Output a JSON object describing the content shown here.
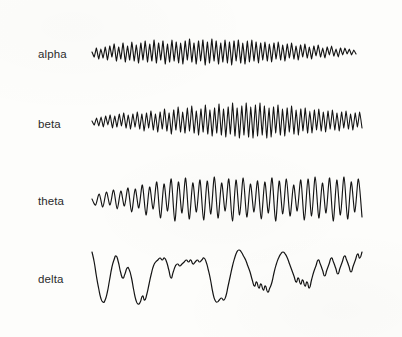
{
  "figure": {
    "width": 402,
    "height": 337,
    "background_color": "#fdfdfb",
    "trace_color": "#141414",
    "label_color": "#2b2b2b"
  },
  "traces": [
    {
      "label": "alpha",
      "label_x": 38,
      "label_y": 49,
      "baseline_y": 52,
      "x_start": 92,
      "x_end": 356,
      "stroke_width": 1.15,
      "description": "alpha rhythm, ~8-12 Hz low amplitude regular oscillation"
    },
    {
      "label": "beta",
      "label_x": 38,
      "label_y": 119,
      "baseline_y": 121,
      "x_start": 92,
      "x_end": 362,
      "stroke_width": 1.1,
      "description": "beta rhythm, fast low amplitude desynchronised activity increasing toward the right"
    },
    {
      "label": "theta",
      "label_x": 38,
      "label_y": 196,
      "baseline_y": 199,
      "x_start": 92,
      "x_end": 362,
      "stroke_width": 1.15,
      "description": "theta rhythm, ~4-7 Hz moderate amplitude waves"
    },
    {
      "label": "delta",
      "label_x": 38,
      "label_y": 274,
      "baseline_y": 276,
      "x_start": 92,
      "x_end": 362,
      "stroke_width": 1.2,
      "description": "delta rhythm, slow high amplitude rolling waves"
    }
  ],
  "chart_data": {
    "type": "line",
    "title": "",
    "xlabel": "",
    "ylabel": "",
    "grid": false,
    "legend_position": "left-labels",
    "axis_visible": false,
    "series": [
      {
        "name": "alpha",
        "x_range": [
          92,
          356
        ],
        "y_center": 52,
        "amplitude_range": [
          5,
          11
        ],
        "values": [
          0,
          -5,
          4,
          -7,
          3,
          -6,
          5,
          -8,
          6,
          -5,
          8,
          -9,
          5,
          -7,
          9,
          -10,
          6,
          -8,
          10,
          -9,
          7,
          -11,
          9,
          -8,
          11,
          -10,
          8,
          -9,
          12,
          -11,
          9,
          -8,
          11,
          -12,
          8,
          -10,
          12,
          -9,
          10,
          -11,
          9,
          -12,
          11,
          -8,
          13,
          -10,
          9,
          -12,
          11,
          -9,
          12,
          -13,
          10,
          -11,
          13,
          -9,
          11,
          -12,
          9,
          -10,
          12,
          -11,
          10,
          -13,
          11,
          -9,
          12,
          -11,
          9,
          -12,
          11,
          -10,
          12,
          -9,
          10,
          -11,
          9,
          -8,
          10,
          -9,
          8,
          -10,
          9,
          -7,
          10,
          -8,
          7,
          -9,
          8,
          -6,
          9,
          -7,
          6,
          -8,
          7,
          -5,
          8,
          -6,
          5,
          -7,
          6,
          -4,
          7,
          -5,
          4,
          -6,
          5,
          -3,
          6,
          -4,
          3,
          -5,
          4,
          -3,
          4,
          -2,
          3,
          -3,
          2,
          -2
        ]
      },
      {
        "name": "beta",
        "x_range": [
          92,
          362
        ],
        "y_center": 121,
        "amplitude_range": [
          4,
          18
        ],
        "values": [
          0,
          -4,
          3,
          -5,
          4,
          -6,
          5,
          -4,
          6,
          -7,
          5,
          -6,
          7,
          -5,
          8,
          -7,
          6,
          -8,
          7,
          -6,
          9,
          -8,
          7,
          -10,
          8,
          -7,
          10,
          -9,
          7,
          -11,
          9,
          -8,
          12,
          -10,
          8,
          -13,
          11,
          -9,
          14,
          -11,
          9,
          -12,
          13,
          -10,
          15,
          -12,
          10,
          -14,
          12,
          -11,
          16,
          -13,
          11,
          -15,
          13,
          -12,
          17,
          -14,
          12,
          -16,
          14,
          -13,
          18,
          -15,
          13,
          -17,
          15,
          -14,
          18,
          -16,
          14,
          -17,
          16,
          -15,
          18,
          -14,
          15,
          -17,
          13,
          -16,
          14,
          -12,
          16,
          -14,
          12,
          -15,
          13,
          -11,
          15,
          -13,
          11,
          -14,
          12,
          -10,
          13,
          -12,
          10,
          -12,
          11,
          -9,
          12,
          -10,
          9,
          -11,
          10,
          -8,
          11,
          -9,
          8,
          -10,
          9,
          -7,
          10,
          -8,
          7,
          -9,
          8,
          -6,
          9,
          -7
        ]
      },
      {
        "name": "theta",
        "x_range": [
          92,
          362
        ],
        "y_center": 199,
        "amplitude_range": [
          6,
          22
        ],
        "values": [
          0,
          -6,
          5,
          -8,
          7,
          -6,
          9,
          -10,
          8,
          -7,
          11,
          -13,
          10,
          -9,
          14,
          -16,
          12,
          -10,
          17,
          -19,
          15,
          -12,
          20,
          -22,
          17,
          -14,
          21,
          -20,
          16,
          -13,
          19,
          -21,
          18,
          -15,
          22,
          -19,
          16,
          -12,
          20,
          -22,
          19,
          -16,
          21,
          -18,
          15,
          -13,
          18,
          -20,
          17,
          -14,
          21,
          -22,
          18,
          -15,
          20,
          -17,
          14,
          -12,
          19,
          -21,
          20,
          -17,
          22,
          -19,
          16,
          -14,
          21,
          -22,
          19,
          -16,
          22,
          -20,
          17,
          -13,
          20,
          -18
        ]
      },
      {
        "name": "delta",
        "x_range": [
          92,
          362
        ],
        "y_center": 276,
        "amplitude_range": [
          10,
          28
        ],
        "values": [
          24,
          14,
          0,
          -12,
          -22,
          -26,
          -24,
          -16,
          -4,
          8,
          16,
          20,
          14,
          4,
          -2,
          2,
          8,
          6,
          -2,
          -14,
          -24,
          -28,
          -26,
          -20,
          -24,
          -18,
          -8,
          2,
          10,
          14,
          16,
          18,
          16,
          18,
          14,
          6,
          -2,
          4,
          10,
          12,
          10,
          12,
          14,
          16,
          14,
          16,
          12,
          14,
          16,
          14,
          16,
          18,
          14,
          6,
          -4,
          -16,
          -24,
          -26,
          -24,
          -22,
          -24,
          -20,
          -10,
          0,
          10,
          18,
          24,
          26,
          24,
          20,
          16,
          10,
          4,
          -4,
          -10,
          -6,
          -12,
          -8,
          -14,
          -10,
          -16,
          -12,
          -6,
          4,
          12,
          18,
          22,
          24,
          22,
          18,
          12,
          6,
          0,
          -6,
          -2,
          -8,
          -4,
          -10,
          -6,
          -12,
          -4,
          4,
          10,
          16,
          12,
          6,
          0,
          6,
          12,
          18,
          14,
          8,
          2,
          8,
          14,
          20,
          16,
          10,
          4,
          10,
          16,
          22,
          18,
          24
        ]
      }
    ]
  }
}
